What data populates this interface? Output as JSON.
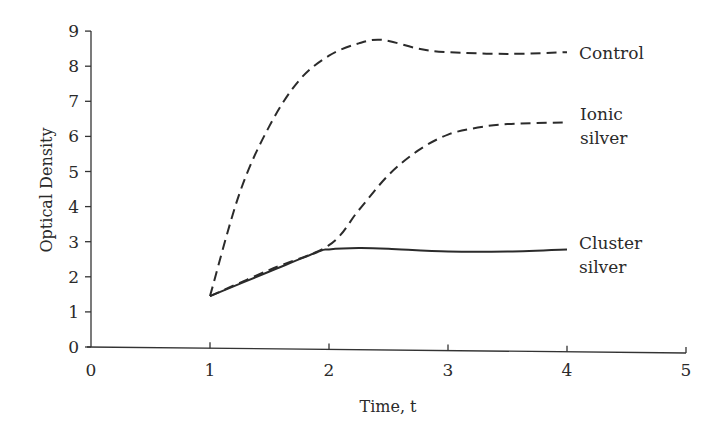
{
  "chart_data": {
    "type": "line",
    "title": "",
    "xlabel": "Time, t",
    "ylabel": "Optical Density",
    "xlim": [
      0,
      5
    ],
    "ylim": [
      0,
      9
    ],
    "xticks": [
      0,
      1,
      2,
      3,
      4,
      5
    ],
    "yticks": [
      0,
      1,
      2,
      3,
      4,
      5,
      6,
      7,
      8,
      9
    ],
    "grid": false,
    "legend": "inline labels at line ends",
    "series": [
      {
        "name": "Control",
        "label_lines": [
          "Control"
        ],
        "style": "dashed",
        "x": [
          1.0,
          1.25,
          1.5,
          1.75,
          2.0,
          2.25,
          2.45,
          2.75,
          3.0,
          3.5,
          4.0
        ],
        "y": [
          1.45,
          4.4,
          6.3,
          7.6,
          8.3,
          8.65,
          8.75,
          8.5,
          8.4,
          8.35,
          8.4
        ]
      },
      {
        "name": "Ionic silver",
        "label_lines": [
          "Ionic",
          "silver"
        ],
        "style": "dashed",
        "x": [
          1.0,
          1.5,
          2.0,
          2.25,
          2.5,
          2.75,
          3.0,
          3.25,
          3.5,
          4.0
        ],
        "y": [
          1.45,
          2.2,
          2.9,
          3.9,
          4.9,
          5.6,
          6.05,
          6.25,
          6.35,
          6.4
        ]
      },
      {
        "name": "Cluster silver",
        "label_lines": [
          "Cluster",
          "silver"
        ],
        "style": "solid",
        "x": [
          1.0,
          1.5,
          1.9,
          2.0,
          2.25,
          2.5,
          3.0,
          3.5,
          4.0
        ],
        "y": [
          1.45,
          2.15,
          2.7,
          2.78,
          2.82,
          2.8,
          2.72,
          2.72,
          2.78
        ]
      }
    ]
  }
}
